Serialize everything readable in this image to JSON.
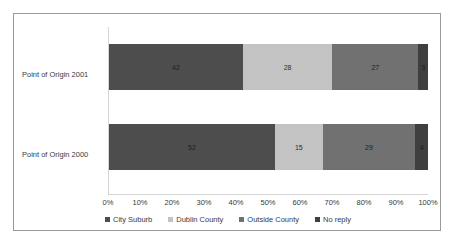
{
  "chart_data": {
    "type": "bar",
    "orientation": "horizontal",
    "stacked": true,
    "normalized_percent": true,
    "title": "",
    "subtitle": "",
    "xlabel": "",
    "ylabel": "",
    "xlim": [
      0,
      100
    ],
    "grid": false,
    "legend_position": "bottom",
    "categories": [
      "Point of Origin 2001",
      "Point of Origin 2000"
    ],
    "xticklabels": [
      "0%",
      "10%",
      "20%",
      "30%",
      "40%",
      "50%",
      "60%",
      "70%",
      "80%",
      "90%",
      "100%"
    ],
    "xtickvalues": [
      0,
      10,
      20,
      30,
      40,
      50,
      60,
      70,
      80,
      90,
      100
    ],
    "series": [
      {
        "name": "City Suburb",
        "color": "#4d4d4d",
        "values": [
          42,
          52
        ]
      },
      {
        "name": "Dublin County",
        "color": "#c3c3c3",
        "values": [
          28,
          15
        ]
      },
      {
        "name": "Outside County",
        "color": "#717171",
        "values": [
          27,
          29
        ]
      },
      {
        "name": "No reply",
        "color": "#3f3f3f",
        "values": [
          3,
          4
        ]
      }
    ],
    "rows": [
      {
        "category": "Point of Origin 2001",
        "segments": [
          {
            "name": "City Suburb",
            "value": 42,
            "label": "42",
            "color": "#4d4d4d"
          },
          {
            "name": "Dublin County",
            "value": 28,
            "label": "28",
            "color": "#c3c3c3"
          },
          {
            "name": "Outside County",
            "value": 27,
            "label": "27",
            "color": "#717171"
          },
          {
            "name": "No reply",
            "value": 3,
            "label": "3",
            "color": "#3f3f3f"
          }
        ]
      },
      {
        "category": "Point of Origin 2000",
        "segments": [
          {
            "name": "City Suburb",
            "value": 52,
            "label": "52",
            "color": "#4d4d4d"
          },
          {
            "name": "Dublin County",
            "value": 15,
            "label": "15",
            "color": "#c3c3c3"
          },
          {
            "name": "Outside County",
            "value": 29,
            "label": "29",
            "color": "#717171"
          },
          {
            "name": "No reply",
            "value": 4,
            "label": "4",
            "color": "#3f3f3f"
          }
        ]
      }
    ]
  },
  "legend": {
    "items": [
      {
        "label": "City Suburb",
        "color": "#4d4d4d",
        "marker": "square-marker-icon"
      },
      {
        "label": "Dublin County",
        "color": "#c3c3c3",
        "marker": "square-marker-icon"
      },
      {
        "label": "Outside County",
        "color": "#717171",
        "marker": "square-marker-icon"
      },
      {
        "label": "No reply",
        "color": "#3f3f3f",
        "marker": "square-marker-icon"
      }
    ]
  },
  "style": {
    "border_color": "#9a9a9a",
    "axis_color": "#d6d6d6",
    "text_color": "#3a3a3a",
    "background": "#ffffff"
  }
}
